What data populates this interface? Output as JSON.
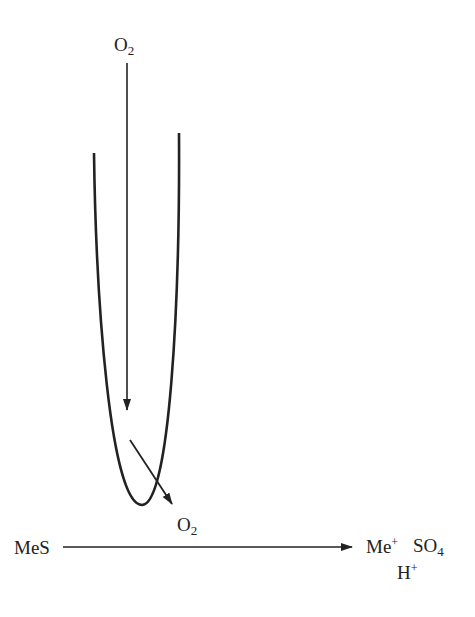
{
  "diagram": {
    "top_oxygen": {
      "base": "O",
      "sub": "2"
    },
    "lower_oxygen": {
      "base": "O",
      "sub": "2"
    },
    "reactant": "MeS",
    "products": {
      "metal_ion": {
        "base": "Me",
        "sup": "+"
      },
      "sulfate": {
        "base": "SO",
        "sub": "4"
      },
      "proton": {
        "base": "H",
        "sup": "+"
      }
    },
    "colors": {
      "stroke": "#222222"
    }
  }
}
